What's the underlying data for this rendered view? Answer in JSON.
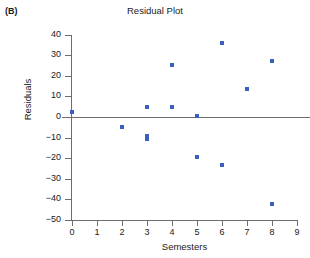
{
  "panel": {
    "label": "(B)"
  },
  "chart_data": {
    "type": "scatter",
    "title": "Residual Plot",
    "xlabel": "Semesters",
    "ylabel": "Residuals",
    "xlim": [
      0,
      9
    ],
    "ylim": [
      -50,
      40
    ],
    "xticks": [
      0,
      1,
      2,
      3,
      4,
      5,
      6,
      7,
      8,
      9
    ],
    "yticks": [
      40,
      30,
      20,
      10,
      0,
      -10,
      -20,
      -30,
      -40,
      -50
    ],
    "xtick_labels": [
      "0",
      "1",
      "2",
      "3",
      "4",
      "5",
      "6",
      "7",
      "8",
      "9"
    ],
    "ytick_labels": [
      "40",
      "30",
      "20",
      "10",
      "0",
      "−10",
      "−20",
      "−30",
      "−40",
      "−50"
    ],
    "grid": false,
    "legend": null,
    "reference_line": {
      "y": 0,
      "color": "#6e6e6e"
    },
    "marker_color": "#3a5fbf",
    "x": [
      0,
      2,
      3,
      3,
      3,
      4,
      4,
      5,
      5,
      6,
      6,
      7,
      8,
      8
    ],
    "y": [
      2.5,
      -5,
      5,
      -9,
      -10.5,
      25.5,
      5,
      0.5,
      -19.5,
      36,
      -23.5,
      13.5,
      27,
      -42.5
    ],
    "points": [
      {
        "x": 0,
        "y": 2.5
      },
      {
        "x": 2,
        "y": -5
      },
      {
        "x": 3,
        "y": 5
      },
      {
        "x": 3,
        "y": -9
      },
      {
        "x": 3,
        "y": -10.5
      },
      {
        "x": 4,
        "y": 25.5
      },
      {
        "x": 4,
        "y": 5
      },
      {
        "x": 5,
        "y": 0.5
      },
      {
        "x": 5,
        "y": -19.5
      },
      {
        "x": 6,
        "y": 36
      },
      {
        "x": 6,
        "y": -23.5
      },
      {
        "x": 7,
        "y": 13.5
      },
      {
        "x": 8,
        "y": 27
      },
      {
        "x": 8,
        "y": -42.5
      }
    ]
  }
}
